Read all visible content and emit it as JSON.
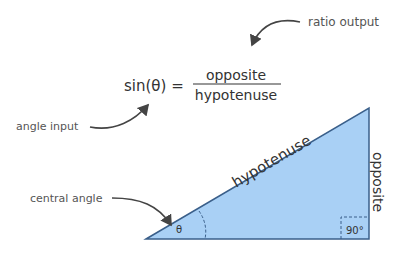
{
  "formula": {
    "lhs": "sin(θ) =",
    "numerator": "opposite",
    "denominator": "hypotenuse"
  },
  "annotations": {
    "ratio_output": "ratio output",
    "angle_input": "angle input",
    "central_angle": "central angle"
  },
  "triangle": {
    "hypotenuse_label": "hypotenuse",
    "opposite_label": "opposite",
    "theta_label": "θ",
    "right_angle_label": "90°",
    "fill_color": "#a9d0f5",
    "stroke_color": "#3a5f8a"
  }
}
